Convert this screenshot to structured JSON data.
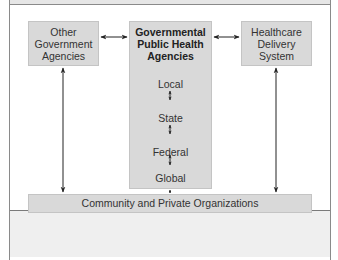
{
  "diagram": {
    "nodes": {
      "other_government": {
        "lines": [
          "Other",
          "Government",
          "Agencies"
        ]
      },
      "central": {
        "title_lines": [
          "Governmental",
          "Public Health",
          "Agencies"
        ],
        "levels": [
          "Local",
          "State",
          "Federal",
          "Global"
        ]
      },
      "healthcare": {
        "lines": [
          "Healthcare",
          "Delivery",
          "System"
        ]
      },
      "community": {
        "label": "Community and Private Organizations"
      }
    },
    "edges": [
      {
        "from": "other_government",
        "to": "central",
        "type": "bidirectional"
      },
      {
        "from": "central",
        "to": "healthcare",
        "type": "bidirectional"
      },
      {
        "from": "other_government",
        "to": "community",
        "type": "bidirectional"
      },
      {
        "from": "central",
        "to": "community",
        "type": "bidirectional"
      },
      {
        "from": "healthcare",
        "to": "community",
        "type": "bidirectional"
      },
      {
        "from": "Local",
        "to": "State",
        "type": "bidirectional"
      },
      {
        "from": "State",
        "to": "Federal",
        "type": "bidirectional"
      },
      {
        "from": "Federal",
        "to": "Global",
        "type": "bidirectional"
      }
    ],
    "colors": {
      "box_fill": "#d9d9d9",
      "arrow": "#222222",
      "frame": "#8a8a8a"
    }
  }
}
